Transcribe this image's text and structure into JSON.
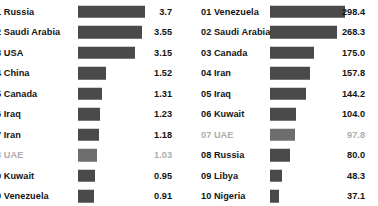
{
  "colors": {
    "bar": "#4a4a4a",
    "bar_muted": "#6e6e6e",
    "text": "#141414",
    "text_muted": "#adadad",
    "background": "#ffffff"
  },
  "chart_data": [
    {
      "type": "bar",
      "title": "",
      "xlabel": "",
      "ylabel": "",
      "orientation": "horizontal",
      "grid": false,
      "legend": false,
      "xlim": [
        0,
        3.7
      ],
      "panel": "left",
      "note": "Leading zero of the rank number is clipped by the left edge of the screenshot",
      "categories": [
        "01 Russia",
        "02 Saudi Arabia",
        "03 USA",
        "04 China",
        "05 Canada",
        "06 Iraq",
        "07 Iran",
        "08 UAE",
        "09 Kuwait",
        "010 Venezuela"
      ],
      "rows": [
        {
          "rank": "01",
          "label": "01 Russia",
          "display_label": "1 Russia",
          "value": 3.7,
          "value_label": "3.7",
          "muted": false
        },
        {
          "rank": "02",
          "label": "02 Saudi Arabia",
          "display_label": "2 Saudi Arabia",
          "value": 3.55,
          "value_label": "3.55",
          "muted": false
        },
        {
          "rank": "03",
          "label": "03 USA",
          "display_label": "3 USA",
          "value": 3.15,
          "value_label": "3.15",
          "muted": false
        },
        {
          "rank": "04",
          "label": "04 China",
          "display_label": "4 China",
          "value": 1.52,
          "value_label": "1.52",
          "muted": false
        },
        {
          "rank": "05",
          "label": "05 Canada",
          "display_label": "5 Canada",
          "value": 1.31,
          "value_label": "1.31",
          "muted": false
        },
        {
          "rank": "06",
          "label": "06 Iraq",
          "display_label": "6 Iraq",
          "value": 1.23,
          "value_label": "1.23",
          "muted": false
        },
        {
          "rank": "07",
          "label": "07 Iran",
          "display_label": "7 Iran",
          "value": 1.18,
          "value_label": "1.18",
          "muted": false
        },
        {
          "rank": "08",
          "label": "08 UAE",
          "display_label": "8 UAE",
          "value": 1.03,
          "value_label": "1.03",
          "muted": true
        },
        {
          "rank": "09",
          "label": "09 Kuwait",
          "display_label": "9 Kuwait",
          "value": 0.95,
          "value_label": "0.95",
          "muted": false
        },
        {
          "rank": "10",
          "label": "10 Venezuela",
          "display_label": "0 Venezuela",
          "value": 0.91,
          "value_label": "0.91",
          "muted": false
        }
      ]
    },
    {
      "type": "bar",
      "title": "",
      "xlabel": "",
      "ylabel": "",
      "orientation": "horizontal",
      "grid": false,
      "legend": false,
      "xlim": [
        0,
        298.4
      ],
      "panel": "right",
      "categories": [
        "01 Venezuela",
        "02 Saudi Arabia",
        "03 Canada",
        "04 Iran",
        "05 Iraq",
        "06 Kuwait",
        "07 UAE",
        "08 Russia",
        "09 Libya",
        "10 Nigeria"
      ],
      "rows": [
        {
          "rank": "01",
          "label": "01 Venezuela",
          "display_label": "01 Venezuela",
          "value": 298.4,
          "value_label": "298.4",
          "muted": false
        },
        {
          "rank": "02",
          "label": "02 Saudi Arabia",
          "display_label": "02 Saudi Arabia",
          "value": 268.3,
          "value_label": "268.3",
          "muted": false
        },
        {
          "rank": "03",
          "label": "03 Canada",
          "display_label": "03 Canada",
          "value": 175.0,
          "value_label": "175.0",
          "muted": false
        },
        {
          "rank": "04",
          "label": "04 Iran",
          "display_label": "04 Iran",
          "value": 157.8,
          "value_label": "157.8",
          "muted": false
        },
        {
          "rank": "05",
          "label": "05 Iraq",
          "display_label": "05 Iraq",
          "value": 144.2,
          "value_label": "144.2",
          "muted": false
        },
        {
          "rank": "06",
          "label": "06 Kuwait",
          "display_label": "06 Kuwait",
          "value": 104.0,
          "value_label": "104.0",
          "muted": false
        },
        {
          "rank": "07",
          "label": "07 UAE",
          "display_label": "07 UAE",
          "value": 97.8,
          "value_label": "97.8",
          "muted": true
        },
        {
          "rank": "08",
          "label": "08 Russia",
          "display_label": "08 Russia",
          "value": 80.0,
          "value_label": "80.0",
          "muted": false
        },
        {
          "rank": "09",
          "label": "09 Libya",
          "display_label": "09 Libya",
          "value": 48.3,
          "value_label": "48.3",
          "muted": false
        },
        {
          "rank": "10",
          "label": "10 Nigeria",
          "display_label": "10 Nigeria",
          "value": 37.1,
          "value_label": "37.1",
          "muted": false
        }
      ]
    }
  ]
}
